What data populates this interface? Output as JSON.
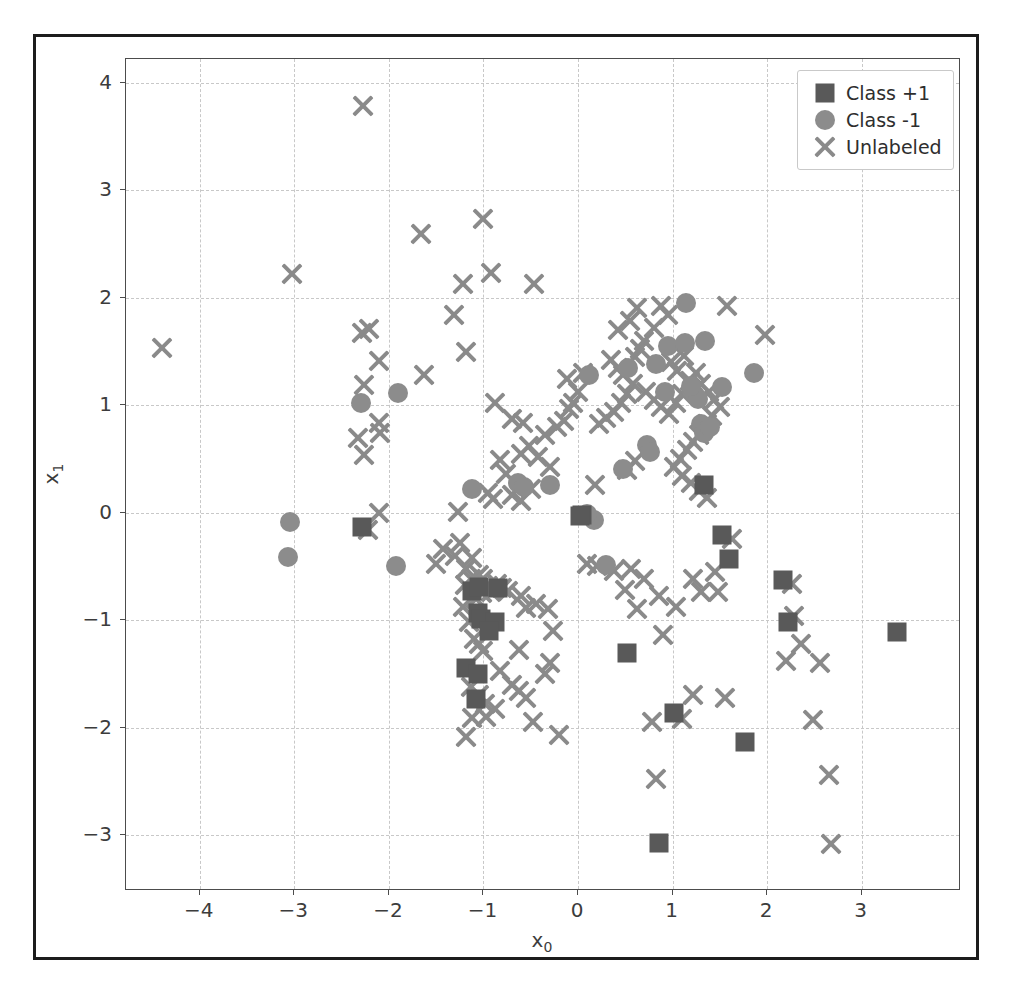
{
  "chart_data": {
    "type": "scatter",
    "title": "",
    "xlabel": "x₀",
    "ylabel": "x₁",
    "xlim": [
      -4.78,
      4.05
    ],
    "ylim": [
      -3.52,
      4.22
    ],
    "xticks": [
      "−4",
      "−3",
      "−2",
      "−1",
      "0",
      "1",
      "2",
      "3"
    ],
    "xtick_values": [
      -4,
      -3,
      -2,
      -1,
      0,
      1,
      2,
      3
    ],
    "yticks": [
      "4",
      "3",
      "2",
      "1",
      "0",
      "−1",
      "−2",
      "−3"
    ],
    "ytick_values": [
      4,
      3,
      2,
      1,
      0,
      -1,
      -2,
      -3
    ],
    "grid": true,
    "legend_position": "upper right",
    "series": [
      {
        "name": "Class +1",
        "marker": "square",
        "color": "#595959",
        "points": [
          [
            -2.28,
            -0.13
          ],
          [
            -1.12,
            -0.73
          ],
          [
            -1.05,
            -0.69
          ],
          [
            -1.06,
            -0.93
          ],
          [
            -1.03,
            -0.99
          ],
          [
            -0.85,
            -0.7
          ],
          [
            -0.88,
            -1.02
          ],
          [
            -0.94,
            -1.1
          ],
          [
            -1.18,
            -1.45
          ],
          [
            -1.06,
            -1.5
          ],
          [
            -1.08,
            -1.73
          ],
          [
            1.33,
            0.26
          ],
          [
            1.52,
            -0.21
          ],
          [
            1.6,
            -0.43
          ],
          [
            2.17,
            -0.63
          ],
          [
            2.22,
            -1.02
          ],
          [
            3.37,
            -1.11
          ],
          [
            0.52,
            -1.31
          ],
          [
            1.02,
            -1.86
          ],
          [
            1.77,
            -2.13
          ],
          [
            0.86,
            -3.07
          ],
          [
            0.04,
            -0.02
          ],
          [
            0.02,
            -0.03
          ]
        ]
      },
      {
        "name": "Class -1",
        "marker": "circle",
        "color": "#8c8c8c",
        "points": [
          [
            -2.3,
            1.02
          ],
          [
            -1.9,
            1.11
          ],
          [
            -3.05,
            -0.09
          ],
          [
            -3.07,
            -0.41
          ],
          [
            -1.93,
            -0.5
          ],
          [
            -1.12,
            0.22
          ],
          [
            -0.63,
            0.28
          ],
          [
            -0.57,
            0.24
          ],
          [
            -0.3,
            0.26
          ],
          [
            0.17,
            -0.07
          ],
          [
            0.09,
            -0.01
          ],
          [
            0.48,
            0.41
          ],
          [
            0.3,
            -0.49
          ],
          [
            0.53,
            1.35
          ],
          [
            0.73,
            0.63
          ],
          [
            0.76,
            0.56
          ],
          [
            0.82,
            1.38
          ],
          [
            0.92,
            1.12
          ],
          [
            0.95,
            1.55
          ],
          [
            1.14,
            1.95
          ],
          [
            1.13,
            1.58
          ],
          [
            1.21,
            1.13
          ],
          [
            1.24,
            1.09
          ],
          [
            1.27,
            1.06
          ],
          [
            1.34,
            1.6
          ],
          [
            1.3,
            0.82
          ],
          [
            1.33,
            0.74
          ],
          [
            1.4,
            0.8
          ],
          [
            1.52,
            1.17
          ],
          [
            1.86,
            1.3
          ],
          [
            0.12,
            1.28
          ],
          [
            1.2,
            1.18
          ]
        ]
      },
      {
        "name": "Unlabeled",
        "marker": "x",
        "color": "#8a8a8a",
        "points": [
          [
            -4.4,
            1.53
          ],
          [
            -3.02,
            2.22
          ],
          [
            -2.27,
            3.78
          ],
          [
            -1.66,
            2.59
          ],
          [
            -1.0,
            2.73
          ],
          [
            -1.22,
            2.13
          ],
          [
            -0.92,
            2.23
          ],
          [
            -0.47,
            2.13
          ],
          [
            -1.31,
            1.84
          ],
          [
            -2.21,
            1.71
          ],
          [
            -2.28,
            1.67
          ],
          [
            -2.1,
            1.41
          ],
          [
            -2.26,
            1.19
          ],
          [
            -2.1,
            0.83
          ],
          [
            -2.33,
            0.69
          ],
          [
            -2.09,
            0.74
          ],
          [
            -2.26,
            0.54
          ],
          [
            -1.63,
            1.28
          ],
          [
            -1.18,
            1.49
          ],
          [
            -0.88,
            1.02
          ],
          [
            -0.7,
            0.87
          ],
          [
            -0.58,
            0.83
          ],
          [
            -0.83,
            0.49
          ],
          [
            -0.76,
            0.36
          ],
          [
            -0.95,
            0.18
          ],
          [
            -0.9,
            0.13
          ],
          [
            -0.7,
            0.16
          ],
          [
            -0.6,
            0.11
          ],
          [
            -0.5,
            0.22
          ],
          [
            -1.27,
            0.01
          ],
          [
            -1.25,
            -0.28
          ],
          [
            -1.43,
            -0.34
          ],
          [
            -1.3,
            -0.4
          ],
          [
            -1.12,
            -0.42
          ],
          [
            -1.18,
            -0.52
          ],
          [
            -1.05,
            -0.58
          ],
          [
            -1.0,
            -0.62
          ],
          [
            -0.95,
            -0.68
          ],
          [
            -1.02,
            -0.75
          ],
          [
            -0.92,
            -0.74
          ],
          [
            -0.86,
            -0.66
          ],
          [
            -0.8,
            -0.7
          ],
          [
            -0.74,
            -0.73
          ],
          [
            -1.08,
            -0.8
          ],
          [
            -1.13,
            -0.62
          ],
          [
            -1.2,
            -0.67
          ],
          [
            -1.22,
            -0.88
          ],
          [
            -1.15,
            -1.02
          ],
          [
            -1.1,
            -1.18
          ],
          [
            -1.05,
            -1.22
          ],
          [
            -1.0,
            -1.29
          ],
          [
            -1.13,
            -1.62
          ],
          [
            -1.05,
            -1.7
          ],
          [
            -0.98,
            -1.78
          ],
          [
            -0.88,
            -1.83
          ],
          [
            -0.97,
            -1.9
          ],
          [
            -1.12,
            -1.91
          ],
          [
            -1.18,
            -2.09
          ],
          [
            -0.83,
            -1.47
          ],
          [
            -0.7,
            -1.6
          ],
          [
            -0.62,
            -1.66
          ],
          [
            -0.55,
            -1.72
          ],
          [
            -0.48,
            -1.95
          ],
          [
            -0.35,
            -1.5
          ],
          [
            -0.3,
            -1.4
          ],
          [
            -0.62,
            -1.28
          ],
          [
            -0.55,
            -0.89
          ],
          [
            -0.6,
            -0.78
          ],
          [
            -0.44,
            -0.85
          ],
          [
            -0.32,
            -0.9
          ],
          [
            -0.26,
            -1.1
          ],
          [
            -0.2,
            -2.07
          ],
          [
            -0.3,
            0.42
          ],
          [
            -0.42,
            0.52
          ],
          [
            -0.52,
            0.62
          ],
          [
            -0.6,
            0.55
          ],
          [
            -0.35,
            0.72
          ],
          [
            -0.22,
            0.8
          ],
          [
            -0.15,
            0.85
          ],
          [
            -0.1,
            0.96
          ],
          [
            -0.05,
            1.02
          ],
          [
            0.0,
            1.12
          ],
          [
            -0.12,
            1.24
          ],
          [
            0.05,
            1.3
          ],
          [
            0.22,
            0.82
          ],
          [
            0.3,
            0.88
          ],
          [
            0.38,
            0.94
          ],
          [
            0.45,
            1.02
          ],
          [
            0.52,
            1.1
          ],
          [
            0.58,
            1.2
          ],
          [
            0.48,
            1.28
          ],
          [
            0.42,
            1.35
          ],
          [
            0.35,
            1.42
          ],
          [
            0.6,
            1.45
          ],
          [
            0.66,
            1.52
          ],
          [
            0.7,
            1.6
          ],
          [
            0.42,
            1.7
          ],
          [
            0.55,
            1.78
          ],
          [
            0.62,
            1.9
          ],
          [
            0.88,
            1.92
          ],
          [
            0.95,
            1.84
          ],
          [
            0.8,
            1.72
          ],
          [
            0.72,
            1.12
          ],
          [
            0.8,
            1.05
          ],
          [
            0.88,
            0.98
          ],
          [
            0.96,
            0.92
          ],
          [
            1.04,
            1.02
          ],
          [
            1.1,
            1.1
          ],
          [
            1.18,
            1.22
          ],
          [
            1.05,
            1.32
          ],
          [
            0.98,
            1.4
          ],
          [
            1.12,
            1.46
          ],
          [
            1.25,
            1.3
          ],
          [
            1.3,
            1.2
          ],
          [
            1.38,
            1.12
          ],
          [
            1.44,
            1.05
          ],
          [
            1.5,
            0.98
          ],
          [
            1.42,
            0.9
          ],
          [
            1.36,
            0.82
          ],
          [
            1.28,
            0.72
          ],
          [
            1.22,
            0.66
          ],
          [
            1.15,
            0.58
          ],
          [
            1.08,
            0.5
          ],
          [
            1.02,
            0.42
          ],
          [
            1.1,
            0.34
          ],
          [
            1.2,
            0.28
          ],
          [
            1.28,
            0.2
          ],
          [
            1.36,
            0.14
          ],
          [
            1.98,
            1.65
          ],
          [
            1.58,
            1.92
          ],
          [
            0.6,
            0.48
          ],
          [
            0.52,
            0.4
          ],
          [
            0.18,
            0.26
          ],
          [
            0.1,
            -0.48
          ],
          [
            0.2,
            -0.5
          ],
          [
            0.38,
            -0.54
          ],
          [
            0.56,
            -0.52
          ],
          [
            0.7,
            -0.62
          ],
          [
            0.86,
            -0.78
          ],
          [
            0.5,
            -0.72
          ],
          [
            0.62,
            -0.9
          ],
          [
            0.9,
            -1.14
          ],
          [
            1.04,
            -0.88
          ],
          [
            1.22,
            -0.62
          ],
          [
            1.3,
            -0.74
          ],
          [
            1.45,
            -0.55
          ],
          [
            1.63,
            -0.25
          ],
          [
            1.48,
            -0.74
          ],
          [
            1.55,
            -1.72
          ],
          [
            1.22,
            -1.7
          ],
          [
            1.1,
            -1.92
          ],
          [
            0.78,
            -1.95
          ],
          [
            0.82,
            -2.48
          ],
          [
            2.26,
            -0.66
          ],
          [
            2.28,
            -0.96
          ],
          [
            2.36,
            -1.22
          ],
          [
            2.2,
            -1.38
          ],
          [
            2.56,
            -1.4
          ],
          [
            2.48,
            -1.93
          ],
          [
            2.65,
            -2.44
          ],
          [
            2.67,
            -3.08
          ],
          [
            -2.1,
            0.0
          ],
          [
            -2.22,
            -0.16
          ],
          [
            -1.5,
            -0.48
          ]
        ]
      }
    ]
  },
  "axis": {
    "xlabel_base": "x",
    "xlabel_sub": "0",
    "ylabel_base": "x",
    "ylabel_sub": "1"
  },
  "legend": {
    "entries": [
      {
        "label": "Class +1",
        "marker": "square"
      },
      {
        "label": "Class -1",
        "marker": "circle"
      },
      {
        "label": "Unlabeled",
        "marker": "x"
      }
    ]
  },
  "colors": {
    "class_pos": "#595959",
    "class_neg": "#8c8c8c",
    "unlabeled": "#8a8a8a",
    "axis": "#4c4c4c",
    "grid": "#c8c8c8",
    "frame": "#1c1c1c"
  }
}
